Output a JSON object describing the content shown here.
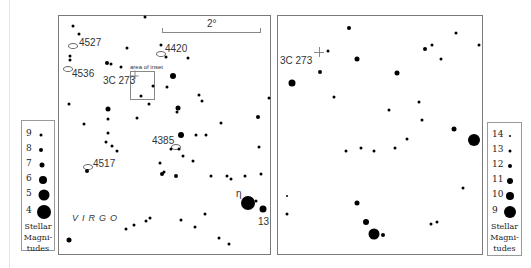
{
  "main_chart": {
    "scale_label": "2°",
    "constellation_label": "VIRGO",
    "inset_label": "area of inset",
    "quasar_label": "3C 273",
    "eta_label": "η",
    "star13_label": "13",
    "galaxies": [
      {
        "id": "4527",
        "label": "4527"
      },
      {
        "id": "4536",
        "label": "4536"
      },
      {
        "id": "4420",
        "label": "4420"
      },
      {
        "id": "4385",
        "label": "4385"
      },
      {
        "id": "4517",
        "label": "4517"
      }
    ],
    "legend": {
      "magnitudes": [
        "9",
        "8",
        "7",
        "6",
        "5",
        "4"
      ],
      "caption_line1": "Stellar",
      "caption_line2": "Magni-",
      "caption_line3": "tudes"
    }
  },
  "inset_chart": {
    "quasar_label": "3C 273",
    "legend": {
      "magnitudes": [
        "14",
        "13",
        "12",
        "11",
        "10",
        "9"
      ],
      "caption_line1": "Stellar",
      "caption_line2": "Magni-",
      "caption_line3": "tudes"
    }
  }
}
